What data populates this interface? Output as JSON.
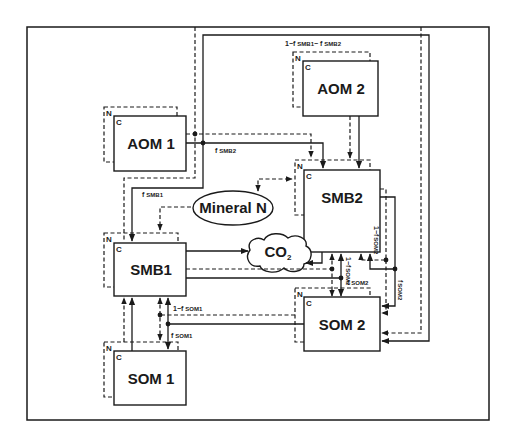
{
  "diagram": {
    "type": "soil organic matter pool flow diagram",
    "legend_implicit": {
      "solid_line": "carbon flow (C)",
      "dashed_line": "nitrogen flow (N)"
    },
    "pools": [
      {
        "id": "aom1",
        "label": "AOM 1",
        "c_label": "C",
        "n_label": "N"
      },
      {
        "id": "aom2",
        "label": "AOM 2",
        "c_label": "C",
        "n_label": "N"
      },
      {
        "id": "smb1",
        "label": "SMB1",
        "c_label": "C",
        "n_label": "N"
      },
      {
        "id": "smb2",
        "label": "SMB2",
        "c_label": "C",
        "n_label": "N"
      },
      {
        "id": "som1",
        "label": "SOM 1",
        "c_label": "C",
        "n_label": "N"
      },
      {
        "id": "som2",
        "label": "SOM 2",
        "c_label": "C",
        "n_label": "N"
      }
    ],
    "sinks": {
      "mineral_n": "Mineral N",
      "co2": "CO",
      "co2_sub": "2"
    },
    "flow_labels": {
      "f_smb1": "f",
      "f_smb1_sub": "SMB1",
      "f_smb2": "f",
      "f_smb2_sub": "SMB2",
      "one_minus_fsmb1_fsmb2": "1−f",
      "one_minus_fsmb1_fsmb2_sub1": "SMB1",
      "one_minus_fsmb1_fsmb2_mid": "− f",
      "one_minus_fsmb1_fsmb2_sub2": "SMB2",
      "one_minus_fsom1": "1−f",
      "one_minus_fsom1_sub": "SOM1",
      "f_som1": "f",
      "f_som1_sub": "SOM1",
      "one_minus_fsom2_a": "1−f",
      "one_minus_fsom2_a_sub": "SOM2",
      "f_som2_a": "f",
      "f_som2_a_sub": "SOM2",
      "one_minus_fsom2_b": "1−f",
      "one_minus_fsom2_b_sub": "SOM2",
      "f_som2_b": "f",
      "f_som2_b_sub": "SOM2"
    }
  }
}
